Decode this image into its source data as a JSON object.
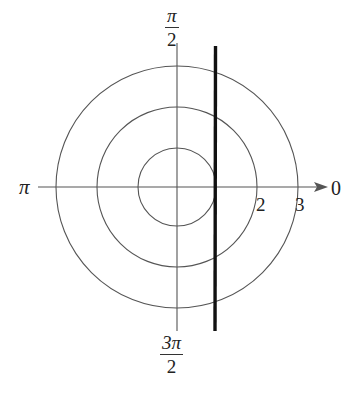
{
  "diagram": {
    "type": "polar_graph",
    "angle_labels": {
      "top": {
        "numerator": "π",
        "denominator": "2"
      },
      "bottom": {
        "numerator": "3π",
        "denominator": "2"
      },
      "left": "π",
      "right": "0"
    },
    "radius_labels": [
      "2",
      "3"
    ],
    "circles": [
      {
        "r": 1
      },
      {
        "r": 2
      },
      {
        "r": 3
      }
    ],
    "line": {
      "description": "vertical line tangent to r=1 circle",
      "x": 1
    },
    "colors": {
      "grid": "#555555",
      "line": "#111111",
      "background": "#ffffff"
    }
  }
}
